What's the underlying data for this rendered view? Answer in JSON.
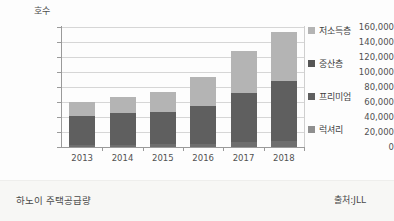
{
  "chart_data": {
    "type": "bar",
    "subtype": "stacked-bar",
    "title": "",
    "ylabel": "호수",
    "xlabel": "",
    "ylim": [
      0,
      160000
    ],
    "ytick_step": 20000,
    "ytick_labels": [
      "0",
      "20,000",
      "40,000",
      "60,000",
      "80,000",
      "100,000",
      "120,000",
      "140,000",
      "160,000"
    ],
    "ytick_values": [
      0,
      20000,
      40000,
      60000,
      80000,
      100000,
      120000,
      140000,
      160000
    ],
    "grid": true,
    "legend_position": "right",
    "categories": [
      "2013",
      "2014",
      "2015",
      "2016",
      "2017",
      "2018"
    ],
    "series": [
      {
        "name": "럭셔리",
        "color": "#6e6e6e",
        "values": [
          3000,
          3000,
          4000,
          4000,
          7000,
          8000
        ]
      },
      {
        "name": "프리미엄",
        "color": "#5f5f5f",
        "values": [
          38000,
          42000,
          43000,
          51000,
          65000,
          80000
        ]
      },
      {
        "name": "중산층",
        "color": "#555555",
        "values": [
          0,
          0,
          0,
          0,
          0,
          0
        ]
      },
      {
        "name": "저소득층",
        "color": "#b4b4b4",
        "values": [
          19000,
          22000,
          26000,
          39000,
          56000,
          65000
        ]
      }
    ],
    "totals": [
      60000,
      67000,
      73000,
      94000,
      128000,
      153000
    ],
    "legend_entries": [
      {
        "label": "저소득층",
        "color": "#b4b4b4"
      },
      {
        "label": "중산층",
        "color": "#555555"
      },
      {
        "label": "프리미엄",
        "color": "#5f5f5f"
      },
      {
        "label": "럭셔리",
        "color": "#8f8f8f"
      }
    ]
  },
  "caption": {
    "left": "하노이 주택공급량",
    "right": "출처:JLL"
  }
}
